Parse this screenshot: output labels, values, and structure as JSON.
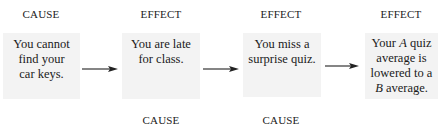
{
  "diagram": {
    "type": "cause-effect-chain",
    "top_labels": [
      "CAUSE",
      "EFFECT",
      "EFFECT",
      "EFFECT"
    ],
    "bottom_labels": [
      "CAUSE",
      "CAUSE"
    ],
    "boxes": [
      {
        "lines": [
          "You cannot",
          "find your",
          "car keys."
        ]
      },
      {
        "lines": [
          "You are late",
          "for class."
        ]
      },
      {
        "lines": [
          "You miss a",
          "surprise quiz."
        ]
      },
      {
        "lines": [
          "Your A quiz",
          "average is",
          "lowered to a",
          "B average."
        ]
      }
    ],
    "box4_parts": {
      "l1_pre": "Your ",
      "l1_ital": "A",
      "l1_post": " quiz",
      "l2": "average is",
      "l3": "lowered to a",
      "l4_ital": "B",
      "l4_post": " average."
    },
    "colors": {
      "box_fill": "#f3f3f3",
      "text": "#1c1c1c",
      "arrow": "#222222"
    }
  }
}
